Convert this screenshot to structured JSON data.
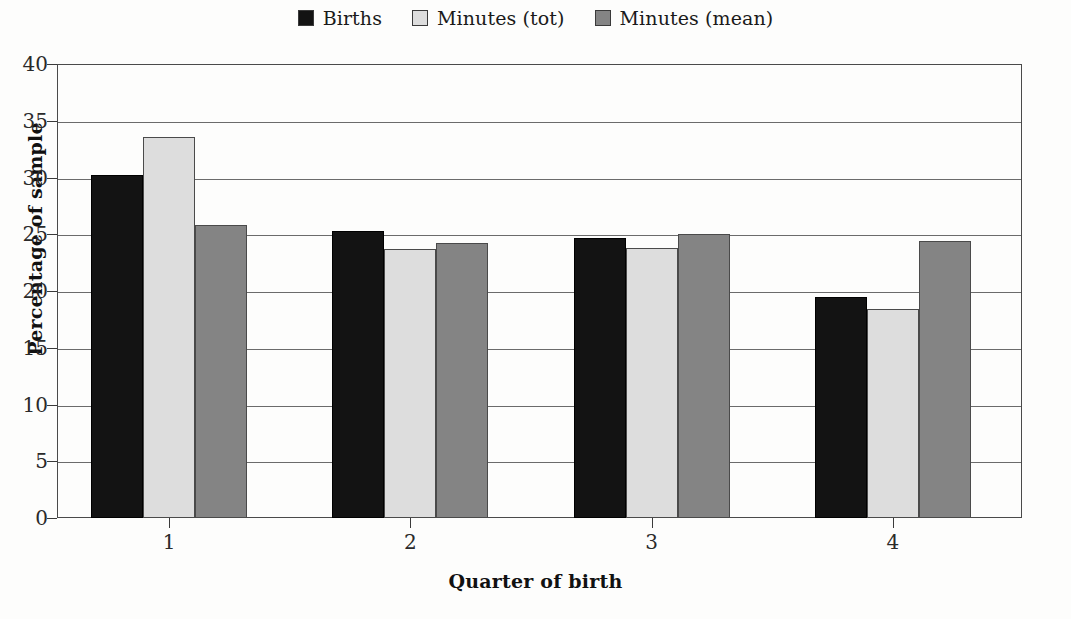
{
  "chart_data": {
    "type": "bar",
    "title": "",
    "xlabel": "Quarter of birth",
    "ylabel": "Percentage of sample",
    "categories": [
      "1",
      "2",
      "3",
      "4"
    ],
    "series": [
      {
        "name": "Births",
        "color": "#131313",
        "values": [
          30.2,
          25.3,
          24.7,
          19.5
        ]
      },
      {
        "name": "Minutes (tot)",
        "color": "#dddddd",
        "values": [
          33.6,
          23.7,
          23.8,
          18.4
        ]
      },
      {
        "name": "Minutes (mean)",
        "color": "#848484",
        "values": [
          25.8,
          24.2,
          25.0,
          24.4
        ]
      }
    ],
    "ylim": [
      0,
      40
    ],
    "yticks": [
      0,
      5,
      10,
      15,
      20,
      25,
      30,
      35,
      40
    ],
    "ytick_labels": [
      "0",
      "5",
      "10",
      "15",
      "20",
      "25",
      "30",
      "35",
      "40"
    ],
    "grid": true,
    "grid_axis": "y",
    "legend_position": "top-center",
    "bar_grouping": "adjacent-no-gap"
  },
  "legend": {
    "entries": [
      {
        "label": "Births",
        "swatch": "legend-swatch-births"
      },
      {
        "label": "Minutes (tot)",
        "swatch": "legend-swatch-minutes-tot"
      },
      {
        "label": "Minutes (mean)",
        "swatch": "legend-swatch-minutes-mean"
      }
    ]
  },
  "axes": {
    "y_title": "Percentage of sample",
    "x_title": "Quarter of birth"
  }
}
